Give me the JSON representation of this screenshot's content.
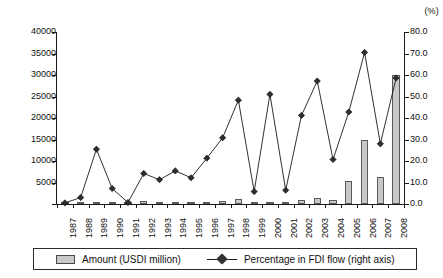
{
  "chart_data": {
    "type": "bar",
    "title": "",
    "subtitle": "",
    "xlabel": "",
    "ylabel": "",
    "secondary_axis_label": "(%)",
    "grid": false,
    "legend_position": "bottom",
    "categories": [
      "1987",
      "1988",
      "1989",
      "1990",
      "1991",
      "1992",
      "1993",
      "1994",
      "1995",
      "1996",
      "1997",
      "1998",
      "1999",
      "2000",
      "2001",
      "2002",
      "2003",
      "2004",
      "2005",
      "2006",
      "2007",
      "2008"
    ],
    "ylim": [
      0,
      40000
    ],
    "yticks": [
      "0",
      "5000",
      "10000",
      "15000",
      "20000",
      "25000",
      "30000",
      "35000",
      "40000"
    ],
    "ylim_right": [
      0,
      80
    ],
    "yticks_right": [
      "0.0",
      "10.0",
      "20.0",
      "30.0",
      "40.0",
      "50.0",
      "60.0",
      "70.0",
      "80.0"
    ],
    "series": [
      {
        "name": "Amount (USDI million)",
        "type": "bar",
        "axis": "left",
        "color": "#c9c9c9",
        "values": [
          120,
          200,
          300,
          180,
          150,
          700,
          250,
          250,
          300,
          450,
          700,
          1200,
          150,
          400,
          400,
          900,
          1500,
          1000,
          5400,
          14900,
          6200,
          30000
        ]
      },
      {
        "name": "Percentage in FDI flow (right axis)",
        "type": "line",
        "axis": "right",
        "color": "#1a1a1a",
        "marker": "diamond",
        "values": [
          0.5,
          3.0,
          25.5,
          7.2,
          0.7,
          14.2,
          11.3,
          15.4,
          12.2,
          21.3,
          30.8,
          48.3,
          5.8,
          51.0,
          6.4,
          41.2,
          57.2,
          20.7,
          42.8,
          70.5,
          28.0,
          58.6
        ]
      }
    ]
  },
  "legend": {
    "items": [
      {
        "label": "Amount (USDI million)",
        "icon": "bar-swatch"
      },
      {
        "label": "Percentage in FDI flow (right axis)",
        "icon": "line-marker-swatch"
      }
    ]
  }
}
